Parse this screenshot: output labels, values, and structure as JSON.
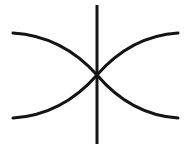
{
  "figure": {
    "title": "Hyperbola with vertical axis",
    "kind": "line-drawing",
    "canvas": {
      "width": 191,
      "height": 148,
      "background_color": "#ffffff"
    },
    "stroke": {
      "color": "#141414",
      "width": 3.0,
      "axis_width": 3.0
    },
    "elements": [
      {
        "name": "vertical-axis",
        "type": "line",
        "x1": 97,
        "y1": 5,
        "x2": 97,
        "y2": 144
      },
      {
        "name": "left-branch-upper",
        "type": "curve",
        "start": [
          13,
          33
        ],
        "end": [
          97,
          75
        ],
        "control": [
          62,
          36
        ]
      },
      {
        "name": "left-branch-lower",
        "type": "curve",
        "start": [
          13,
          118
        ],
        "end": [
          97,
          75
        ],
        "control": [
          62,
          115
        ]
      },
      {
        "name": "right-branch-upper",
        "type": "curve",
        "start": [
          178,
          33
        ],
        "end": [
          97,
          75
        ],
        "control": [
          131,
          36
        ]
      },
      {
        "name": "right-branch-lower",
        "type": "curve",
        "start": [
          178,
          118
        ],
        "end": [
          97,
          75
        ],
        "control": [
          131,
          115
        ]
      }
    ],
    "crossing_point": {
      "name": "center-node",
      "x": 97,
      "y": 75
    }
  },
  "chart_data": {
    "type": "line",
    "title": "Hyperbola with vertical axis",
    "xlabel": "",
    "ylabel": "",
    "xlim": [
      0,
      191
    ],
    "ylim": [
      148,
      0
    ],
    "grid": false,
    "legend": "none",
    "series": [
      {
        "name": "vertical-axis",
        "x": [
          97,
          97
        ],
        "y": [
          5,
          144
        ]
      },
      {
        "name": "left-branch-upper",
        "x": [
          13,
          34,
          55,
          76,
          89,
          97
        ],
        "y": [
          33,
          41,
          50,
          61,
          68,
          75
        ]
      },
      {
        "name": "left-branch-lower",
        "x": [
          13,
          34,
          55,
          76,
          89,
          97
        ],
        "y": [
          118,
          110,
          101,
          90,
          83,
          75
        ]
      },
      {
        "name": "right-branch-upper",
        "x": [
          178,
          158,
          137,
          116,
          104,
          97
        ],
        "y": [
          33,
          41,
          50,
          61,
          68,
          75
        ]
      },
      {
        "name": "right-branch-lower",
        "x": [
          178,
          158,
          137,
          116,
          104,
          97
        ],
        "y": [
          118,
          110,
          101,
          90,
          83,
          75
        ]
      }
    ],
    "annotations": []
  }
}
